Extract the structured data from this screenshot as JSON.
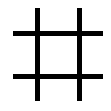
{
  "icon": {
    "name": "hash-grid-icon",
    "color": "#000000",
    "background": "#ffffff",
    "lines": {
      "vertical": [
        {
          "x": 35,
          "y": 8,
          "w": 5,
          "h": 93
        },
        {
          "x": 77,
          "y": 8,
          "w": 5,
          "h": 93
        }
      ],
      "horizontal": [
        {
          "x": 13,
          "y": 31,
          "w": 90,
          "h": 5
        },
        {
          "x": 13,
          "y": 74,
          "w": 90,
          "h": 5
        }
      ]
    }
  }
}
